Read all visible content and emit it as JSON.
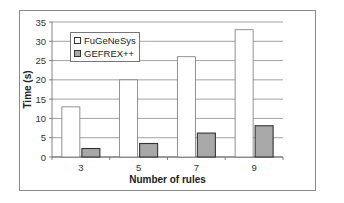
{
  "chart_data": {
    "type": "bar",
    "title": "",
    "xlabel": "Number of rules",
    "ylabel": "Time (s)",
    "categories": [
      "3",
      "5",
      "7",
      "9"
    ],
    "series": [
      {
        "name": "FuGeNeSys",
        "values": [
          13,
          20,
          26,
          33
        ],
        "color": "#ffffff"
      },
      {
        "name": "GEFREX++",
        "values": [
          2.2,
          3.5,
          6.2,
          8.1
        ],
        "color": "#a8a8a8"
      }
    ],
    "ylim": [
      0,
      35
    ],
    "yticks": [
      0,
      5,
      10,
      15,
      20,
      25,
      30,
      35
    ],
    "grid": true,
    "legend_position": "upper-left inside"
  },
  "legend": {
    "items": [
      {
        "label": "FuGeNeSys"
      },
      {
        "label": "GEFREX++"
      }
    ]
  },
  "axes": {
    "x_title": "Number of rules",
    "y_title": "Time (s)"
  }
}
